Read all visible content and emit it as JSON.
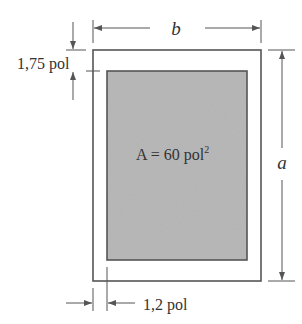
{
  "diagram": {
    "labels": {
      "b": "b",
      "a": "a",
      "top_margin": "1,75 pol",
      "side_margin": "1,2 pol",
      "area_main": "A = 60 pol",
      "area_exp": "2"
    },
    "colors": {
      "stroke": "#555555",
      "fill": "#b3b3b3",
      "text": "#333333",
      "background": "#ffffff"
    },
    "outer_rect": {
      "x": 93,
      "y": 50,
      "w": 168,
      "h": 231
    },
    "inner_rect": {
      "x": 107,
      "y": 71,
      "w": 140,
      "h": 189
    }
  }
}
